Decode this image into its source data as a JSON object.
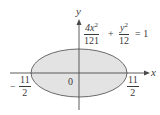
{
  "figure": {
    "type": "ellipse-diagram",
    "axes": {
      "x_label": "x",
      "y_label": "y",
      "origin_label": "0"
    },
    "equation": {
      "term1_numerator": "4x",
      "term1_numerator_exp": "2",
      "term1_denominator": "121",
      "plus": "+",
      "term2_numerator": "y",
      "term2_numerator_exp": "2",
      "term2_denominator": "12",
      "equals": "= 1"
    },
    "intercepts": {
      "left": {
        "sign": "−",
        "numerator": "11",
        "denominator": "2"
      },
      "right": {
        "numerator": "11",
        "denominator": "2"
      }
    },
    "colors": {
      "ellipse_fill": "#e3e3e3",
      "ellipse_stroke": "#6a6a6a",
      "axis": "#4a4a4a",
      "text": "#3a3a3a"
    }
  }
}
